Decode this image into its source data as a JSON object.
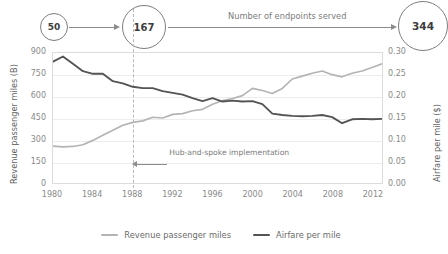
{
  "flow": {
    "label": "Number of endpoints served",
    "nodes": [
      {
        "value": "50"
      },
      {
        "value": "167"
      },
      {
        "value": "344"
      }
    ]
  },
  "annotation": {
    "text": "Hub-and-spoke implementation",
    "at_year": 1988
  },
  "legend": [
    {
      "label": "Revenue passenger miles",
      "color": "#b4b4b4"
    },
    {
      "label": "Airfare per mile",
      "color": "#545454"
    }
  ],
  "chart_data": {
    "type": "line",
    "title": "",
    "xlabel": "",
    "ylabel": "Revenue passenger miles (B)",
    "y2label": "Airfare per mile ($)",
    "grid": true,
    "legend_position": "bottom",
    "xlim": [
      1980,
      2013
    ],
    "ylim": [
      0,
      900
    ],
    "y2lim": [
      0.0,
      0.3
    ],
    "yticks": [
      0,
      150,
      300,
      450,
      600,
      750,
      900
    ],
    "y2ticks": [
      "0.00",
      "0.05",
      "0.10",
      "0.15",
      "0.20",
      "0.25",
      "0.30"
    ],
    "xticks": [
      1980,
      1984,
      1988,
      1992,
      1996,
      2000,
      2004,
      2008,
      2012
    ],
    "x": [
      1980,
      1981,
      1982,
      1983,
      1984,
      1985,
      1986,
      1987,
      1988,
      1989,
      1990,
      1991,
      1992,
      1993,
      1994,
      1995,
      1996,
      1997,
      1998,
      1999,
      2000,
      2001,
      2002,
      2003,
      2004,
      2005,
      2006,
      2007,
      2008,
      2009,
      2010,
      2011,
      2012,
      2013
    ],
    "series": [
      {
        "name": "Revenue passenger miles",
        "axis": "left",
        "color": "#b4b4b4",
        "values": [
          255,
          250,
          253,
          265,
          295,
          330,
          365,
          400,
          420,
          430,
          455,
          450,
          475,
          480,
          500,
          510,
          545,
          570,
          585,
          605,
          655,
          640,
          620,
          655,
          720,
          740,
          760,
          775,
          750,
          735,
          760,
          775,
          800,
          825
        ]
      },
      {
        "name": "Airfare per mile",
        "axis": "right",
        "color": "#545454",
        "values": [
          0.28,
          0.292,
          0.275,
          0.258,
          0.252,
          0.252,
          0.235,
          0.23,
          0.222,
          0.219,
          0.219,
          0.212,
          0.208,
          0.204,
          0.196,
          0.189,
          0.196,
          0.188,
          0.19,
          0.188,
          0.189,
          0.182,
          0.16,
          0.157,
          0.155,
          0.154,
          0.155,
          0.157,
          0.152,
          0.138,
          0.147,
          0.148,
          0.147,
          0.148
        ]
      }
    ]
  }
}
